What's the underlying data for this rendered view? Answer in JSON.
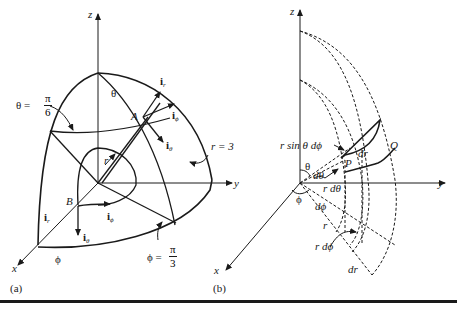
{
  "figure": {
    "panels": [
      {
        "id": "a",
        "caption": "(a)",
        "axes": {
          "x": "x",
          "y": "y",
          "z": "z"
        },
        "labels": {
          "theta_eq_prefix": "θ =",
          "theta_eq_num": "π",
          "theta_eq_den": "6",
          "theta": "θ",
          "point_A": "A",
          "point_B": "B",
          "r": "r",
          "r_eq": "r = 3",
          "phi": "ϕ",
          "phi_eq_prefix": "ϕ =",
          "phi_eq_num": "π",
          "phi_eq_den": "3",
          "unit_vectors_A": [
            {
              "base": "i",
              "sub": "r"
            },
            {
              "base": "i",
              "sub": "ϕ"
            },
            {
              "base": "i",
              "sub": "θ"
            }
          ],
          "unit_vectors_B": [
            {
              "base": "i",
              "sub": "r"
            },
            {
              "base": "i",
              "sub": "ϕ"
            },
            {
              "base": "i",
              "sub": "θ"
            }
          ]
        }
      },
      {
        "id": "b",
        "caption": "(b)",
        "axes": {
          "x": "x",
          "y": "y",
          "z": "z"
        },
        "labels": {
          "r_sin_theta_dphi": "r sin θ dϕ",
          "dr_top": "dr",
          "point_Q": "Q",
          "point_P": "P",
          "theta": "θ",
          "d_theta": "dθ",
          "r_d_theta": "r dθ",
          "phi": "ϕ",
          "d_phi": "dϕ",
          "r": "r",
          "r_d_phi": "r dϕ",
          "dr_bottom": "dr"
        }
      }
    ],
    "colors": {
      "ink": "#1a1a1a",
      "background": "#ffffff"
    }
  }
}
